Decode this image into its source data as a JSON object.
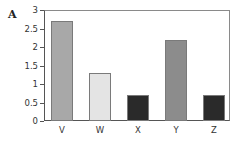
{
  "panel_label": "A",
  "chart_data": {
    "type": "bar",
    "title": "",
    "xlabel": "",
    "ylabel": "",
    "categories": [
      "V",
      "W",
      "X",
      "Y",
      "Z"
    ],
    "values": [
      2.7,
      1.3,
      0.7,
      2.2,
      0.7
    ],
    "colors": [
      "#a8a8a8",
      "#e4e4e4",
      "#2a2a2a",
      "#8c8c8c",
      "#2a2a2a"
    ],
    "ylim": [
      0,
      3
    ],
    "yticks": [
      "0",
      "0.5",
      "1",
      "1.5",
      "2",
      "2.5",
      "3"
    ],
    "grid": false,
    "legend": null
  }
}
